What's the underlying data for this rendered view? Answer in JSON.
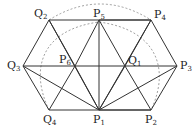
{
  "diagram": {
    "type": "geometry",
    "colors": {
      "line": "#333333",
      "dashed": "#888888",
      "background": "#ffffff"
    },
    "points": [
      {
        "id": "P1",
        "base": "P",
        "sub": "1",
        "x": 99,
        "y": 110,
        "lx": 93,
        "ly": 114
      },
      {
        "id": "P2",
        "base": "P",
        "sub": "2",
        "x": 151,
        "y": 110,
        "lx": 145,
        "ly": 114
      },
      {
        "id": "P3",
        "base": "P",
        "sub": "3",
        "x": 177,
        "y": 66,
        "lx": 180,
        "ly": 60
      },
      {
        "id": "P4",
        "base": "P",
        "sub": "4",
        "x": 151,
        "y": 20,
        "lx": 154,
        "ly": 9
      },
      {
        "id": "P5",
        "base": "P",
        "sub": "5",
        "x": 99,
        "y": 20,
        "lx": 93,
        "ly": 8
      },
      {
        "id": "P6",
        "base": "P",
        "sub": "6",
        "x": 75,
        "y": 66,
        "lx": 59,
        "ly": 54
      },
      {
        "id": "Q1",
        "base": "Q",
        "sub": "1",
        "x": 125,
        "y": 66,
        "lx": 128,
        "ly": 55
      },
      {
        "id": "Q2",
        "base": "Q",
        "sub": "2",
        "x": 49,
        "y": 20,
        "lx": 34,
        "ly": 8
      },
      {
        "id": "Q3",
        "base": "Q",
        "sub": "3",
        "x": 23,
        "y": 66,
        "lx": 7,
        "ly": 60
      },
      {
        "id": "Q4",
        "base": "Q",
        "sub": "4",
        "x": 49,
        "y": 110,
        "lx": 43,
        "ly": 114
      }
    ],
    "labels": {
      "P1": {
        "base": "P",
        "sub": "1"
      },
      "P2": {
        "base": "P",
        "sub": "2"
      },
      "P3": {
        "base": "P",
        "sub": "3"
      },
      "P4": {
        "base": "P",
        "sub": "4"
      },
      "P5": {
        "base": "P",
        "sub": "5"
      },
      "P6": {
        "base": "P",
        "sub": "6"
      },
      "Q1": {
        "base": "Q",
        "sub": "1"
      },
      "Q2": {
        "base": "Q",
        "sub": "2"
      },
      "Q3": {
        "base": "Q",
        "sub": "3"
      },
      "Q4": {
        "base": "Q",
        "sub": "4"
      }
    },
    "hexagon_P": [
      "P1",
      "P2",
      "P3",
      "P4",
      "P5",
      "P6"
    ],
    "hexagon_Q": [
      "P1",
      "Q1",
      "P5",
      "Q2",
      "Q3",
      "Q4"
    ],
    "solid_segments": [
      [
        "Q2",
        "P4"
      ],
      [
        "Q3",
        "P3"
      ],
      [
        "Q4",
        "P2"
      ],
      [
        "P1",
        "P2"
      ],
      [
        "P2",
        "P3"
      ],
      [
        "P3",
        "P4"
      ],
      [
        "P4",
        "P5"
      ],
      [
        "P5",
        "P6"
      ],
      [
        "P6",
        "P1"
      ],
      [
        "Q2",
        "Q3"
      ],
      [
        "Q3",
        "Q4"
      ],
      [
        "P5",
        "P1"
      ],
      [
        "Q2",
        "P1"
      ],
      [
        "P4",
        "P1"
      ],
      [
        "Q3",
        "P1"
      ],
      [
        "P3",
        "P1"
      ],
      [
        "Q2",
        "P6"
      ],
      [
        "P4",
        "Q1"
      ],
      [
        "P5",
        "Q1"
      ],
      [
        "Q1",
        "P1"
      ],
      [
        "Q1",
        "P2"
      ],
      [
        "Q4",
        "P6"
      ]
    ],
    "dashed_arcs": [
      {
        "name": "outer-arc",
        "from": "Q2",
        "to": "P4"
      },
      {
        "name": "inner-arc",
        "from": "Q4",
        "to": "P2"
      }
    ]
  }
}
